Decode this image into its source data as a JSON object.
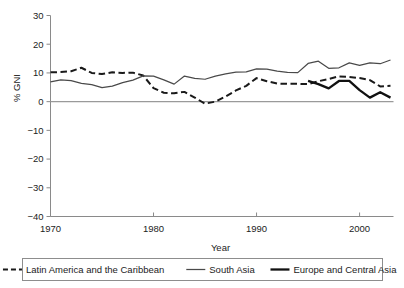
{
  "chart_data": {
    "type": "line",
    "title": "",
    "xlabel": "Year",
    "ylabel": "% GNI",
    "xlim": [
      1970,
      2003
    ],
    "ylim": [
      -40,
      30
    ],
    "grid": false,
    "legend_position": "bottom",
    "x_tick_labels": [
      "1970",
      "1980",
      "1990",
      "2000"
    ],
    "x_ticks": [
      1970,
      1980,
      1990,
      2000
    ],
    "y_tick_labels": [
      "30",
      "20",
      "10",
      "0",
      "−10",
      "−20",
      "−30",
      "−40"
    ],
    "y_ticks": [
      30,
      20,
      10,
      0,
      -10,
      -20,
      -30,
      -40
    ],
    "x": [
      1970,
      1971,
      1972,
      1973,
      1974,
      1975,
      1976,
      1977,
      1978,
      1979,
      1980,
      1981,
      1982,
      1983,
      1984,
      1985,
      1986,
      1987,
      1988,
      1989,
      1990,
      1991,
      1992,
      1993,
      1994,
      1995,
      1996,
      1997,
      1998,
      1999,
      2000,
      2001,
      2002,
      2003
    ],
    "series": [
      {
        "name": "Latin America and the Caribbean",
        "style": "dashed",
        "color": "#1a1a1a",
        "width": 2.0,
        "values": [
          10.2,
          10.3,
          10.6,
          11.8,
          10.0,
          9.6,
          10.2,
          10.0,
          10.1,
          9.1,
          4.7,
          3.1,
          2.9,
          3.4,
          1.4,
          -0.7,
          0.0,
          1.8,
          3.9,
          5.5,
          8.2,
          7.1,
          6.3,
          6.2,
          6.2,
          6.1,
          7.1,
          7.9,
          8.8,
          8.6,
          8.2,
          7.5,
          5.3,
          5.5
        ]
      },
      {
        "name": "South Asia",
        "style": "solid",
        "color": "#4a4a4a",
        "width": 1.25,
        "values": [
          6.9,
          7.6,
          7.3,
          6.4,
          5.9,
          4.9,
          5.4,
          6.6,
          7.5,
          9.0,
          8.9,
          7.6,
          6.1,
          8.9,
          8.1,
          7.8,
          8.9,
          9.7,
          10.3,
          10.4,
          11.4,
          11.3,
          10.6,
          10.2,
          10.1,
          13.3,
          14.1,
          11.6,
          11.8,
          13.5,
          12.6,
          13.5,
          13.2,
          14.5
        ]
      },
      {
        "name": "Europe and Central Asia",
        "style": "solid",
        "color": "#111111",
        "width": 2.3,
        "start_index": 25,
        "values": [
          null,
          null,
          null,
          null,
          null,
          null,
          null,
          null,
          null,
          null,
          null,
          null,
          null,
          null,
          null,
          null,
          null,
          null,
          null,
          null,
          null,
          null,
          null,
          null,
          null,
          7.2,
          6.1,
          4.6,
          7.2,
          7.2,
          4.0,
          1.4,
          3.3,
          1.4
        ]
      }
    ]
  },
  "legend": {
    "items": [
      {
        "label": "Latin America and the Caribbean",
        "style": "dashed"
      },
      {
        "label": "South Asia",
        "style": "thin"
      },
      {
        "label": "Europe and Central Asia",
        "style": "thick"
      }
    ]
  }
}
